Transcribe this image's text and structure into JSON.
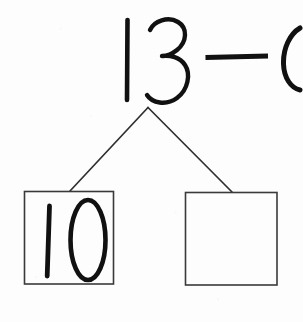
{
  "worksheet": {
    "type": "number-bond-subtraction",
    "title": "Number bond decomposition worksheet",
    "background_color": "#fdfdfd",
    "ink_color": "#111111",
    "line_color": "#3a3a3a"
  },
  "equation": {
    "minuend": "13",
    "operator": "—",
    "operator_name": "minus-sign",
    "subtrahend_partial": "6",
    "subtrahend_clipped": true,
    "full_text": "13 — 6"
  },
  "number_bond": {
    "whole_label": "13",
    "branch_left_name": "bond-branch-left",
    "branch_right_name": "bond-branch-right",
    "parts": [
      {
        "position": "left",
        "value": "10",
        "filled": true
      },
      {
        "position": "right",
        "value": "",
        "filled": false
      }
    ]
  }
}
